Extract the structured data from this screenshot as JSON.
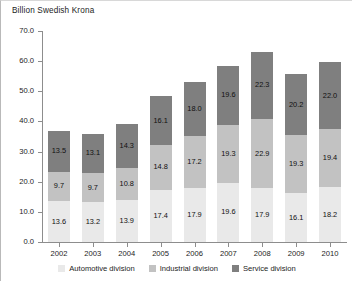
{
  "chart_data": {
    "type": "bar",
    "subtype": "stacked-bar",
    "title": "Billion Swedish Krona",
    "xlabel": "",
    "ylabel": "Billion Swedish Krona",
    "ylim": [
      0.0,
      70.0
    ],
    "ytick_step": 10.0,
    "ytick_labels": [
      "0.0",
      "10.0",
      "20.0",
      "30.0",
      "40.0",
      "50.0",
      "60.0",
      "70.0"
    ],
    "yticks": [
      0.0,
      10.0,
      20.0,
      30.0,
      40.0,
      50.0,
      60.0,
      70.0
    ],
    "grid": false,
    "legend_position": "bottom",
    "categories": [
      "2002",
      "2003",
      "2004",
      "2005",
      "2006",
      "2007",
      "2008",
      "2009",
      "2010"
    ],
    "series": [
      {
        "name": "Automotive division",
        "color": "#e9e9e9",
        "values": [
          13.6,
          13.2,
          13.9,
          17.4,
          17.9,
          19.6,
          17.9,
          16.1,
          18.2
        ],
        "labels": [
          "13.6",
          "13.2",
          "13.9",
          "17.4",
          "17.9",
          "19.6",
          "17.9",
          "16.1",
          "18.2"
        ]
      },
      {
        "name": "Industrial division",
        "color": "#c2c2c2",
        "values": [
          9.7,
          9.7,
          10.8,
          14.8,
          17.2,
          19.3,
          22.9,
          19.3,
          19.4
        ],
        "labels": [
          "9.7",
          "9.7",
          "10.8",
          "14.8",
          "17.2",
          "19.3",
          "22.9",
          "19.3",
          "19.4"
        ]
      },
      {
        "name": "Service division",
        "color": "#7f7f7f",
        "values": [
          13.5,
          13.1,
          14.3,
          16.1,
          18.0,
          19.6,
          22.3,
          20.2,
          22.0
        ],
        "labels": [
          "13.5",
          "13.1",
          "14.3",
          "16.1",
          "18.0",
          "19.6",
          "22.3",
          "20.2",
          "22.0"
        ]
      }
    ],
    "totals": [
      36.8,
      36.0,
      39.0,
      48.3,
      53.1,
      58.5,
      63.1,
      55.6,
      59.6
    ]
  },
  "legend": {
    "items": [
      {
        "label": "Automotive division",
        "color": "#e9e9e9"
      },
      {
        "label": "Industrial division",
        "color": "#c2c2c2"
      },
      {
        "label": "Service division",
        "color": "#7f7f7f"
      }
    ]
  },
  "colors": {
    "automotive": "#e9e9e9",
    "industrial": "#c2c2c2",
    "service": "#7f7f7f",
    "axis": "#8d8d8d",
    "text": "#1c1c1c",
    "background": "#ffffff"
  }
}
